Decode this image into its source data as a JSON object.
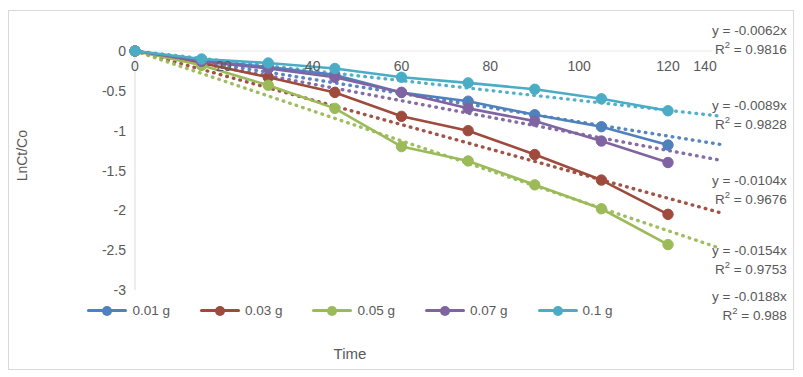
{
  "chart_data": {
    "type": "line",
    "title": "",
    "xlabel": "Time",
    "ylabel": "LnCt/Co",
    "xlim": [
      0,
      140
    ],
    "ylim": [
      -3,
      0
    ],
    "xticks": [
      "0",
      "20",
      "40",
      "60",
      "80",
      "100",
      "120",
      "140"
    ],
    "yticks": [
      "0",
      "-0.5",
      "-1",
      "-1.5",
      "-2",
      "-2.5",
      "-3"
    ],
    "x": [
      0,
      15,
      30,
      45,
      60,
      75,
      90,
      105,
      120
    ],
    "grid": false,
    "legend_position": "bottom",
    "series": [
      {
        "name": "0.01 g",
        "color": "#4F81BD",
        "values": [
          0,
          -0.12,
          -0.2,
          -0.3,
          -0.52,
          -0.63,
          -0.8,
          -0.95,
          -1.18
        ],
        "equation": "y = -0.0089x",
        "r2": "R² = 0.9828"
      },
      {
        "name": "0.03 g",
        "color": "#9E4A3C",
        "values": [
          0,
          -0.15,
          -0.33,
          -0.52,
          -0.82,
          -1.0,
          -1.3,
          -1.62,
          -2.05
        ],
        "equation": "y = -0.0154x",
        "r2": "R² = 0.9753"
      },
      {
        "name": "0.05 g",
        "color": "#9BBB59",
        "values": [
          0,
          -0.18,
          -0.43,
          -0.72,
          -1.2,
          -1.38,
          -1.68,
          -1.98,
          -2.43
        ],
        "equation": "y = -0.0188x",
        "r2": "R² = 0.988"
      },
      {
        "name": "0.07 g",
        "color": "#8064A2",
        "values": [
          0,
          -0.13,
          -0.22,
          -0.33,
          -0.52,
          -0.72,
          -0.88,
          -1.13,
          -1.4
        ],
        "equation": "y = -0.0104x",
        "r2": "R² = 0.9676"
      },
      {
        "name": "0.1 g",
        "color": "#4BACC6",
        "values": [
          0,
          -0.1,
          -0.15,
          -0.22,
          -0.33,
          -0.4,
          -0.48,
          -0.6,
          -0.75
        ],
        "equation": "y = -0.0062x",
        "r2": "R² = 0.9816"
      }
    ],
    "trendlines": [
      {
        "name": "0.01 g",
        "color": "#4F81BD",
        "slope": -0.0089,
        "style": "dotted"
      },
      {
        "name": "0.03 g",
        "color": "#9E4A3C",
        "slope": -0.0154,
        "style": "dotted"
      },
      {
        "name": "0.05 g",
        "color": "#9BBB59",
        "slope": -0.0188,
        "style": "dotted"
      },
      {
        "name": "0.07 g",
        "color": "#8064A2",
        "slope": -0.0104,
        "style": "dotted"
      },
      {
        "name": "0.1 g",
        "color": "#4BACC6",
        "slope": -0.0062,
        "style": "dotted"
      }
    ],
    "annotations": [
      {
        "equation": "y = -0.0062x",
        "r2": "R² = 0.9816"
      },
      {
        "equation": "y = -0.0089x",
        "r2": "R² = 0.9828"
      },
      {
        "equation": "y = -0.0104x",
        "r2": "R² = 0.9676"
      },
      {
        "equation": "y = -0.0154x",
        "r2": "R² = 0.9753"
      },
      {
        "equation": "y = -0.0188x",
        "r2": "R² = 0.988"
      }
    ]
  },
  "axis": {
    "x_title": "Time",
    "y_title": "LnCt/Co",
    "x_extra_tick": "140"
  }
}
